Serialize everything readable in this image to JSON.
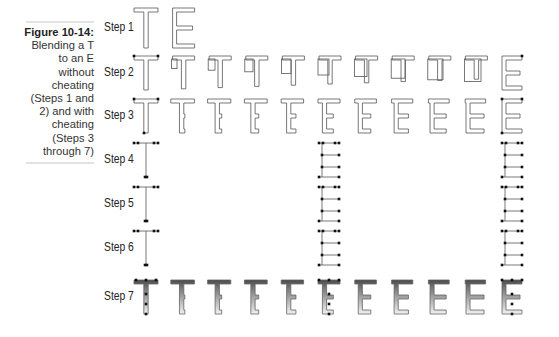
{
  "caption": {
    "figure_label": "Figure 10-14:",
    "text_lines": [
      "Blending a T",
      "to an E",
      "without",
      "cheating",
      "(Steps 1 and",
      "2) and with",
      "cheating",
      "(Steps 3",
      "through 7)"
    ]
  },
  "steps": [
    {
      "label": "Step 1",
      "y": 28,
      "columns": [
        0,
        1
      ],
      "kind": "outline-te"
    },
    {
      "label": "Step 2",
      "y": 73,
      "columns": [
        0,
        1,
        2,
        3,
        4,
        5,
        6,
        7,
        8,
        9,
        10
      ],
      "kind": "blend-no-cheat"
    },
    {
      "label": "Step 3",
      "y": 116,
      "columns": [
        0,
        1,
        2,
        3,
        4,
        5,
        6,
        7,
        8,
        9,
        10
      ],
      "kind": "blend-cheat-outline"
    },
    {
      "label": "Step 4",
      "y": 160,
      "columns": [
        0,
        5,
        10
      ],
      "kind": "points"
    },
    {
      "label": "Step 5",
      "y": 204,
      "columns": [
        0,
        5,
        10
      ],
      "kind": "points"
    },
    {
      "label": "Step 6",
      "y": 248,
      "columns": [
        0,
        5,
        10
      ],
      "kind": "points"
    },
    {
      "label": "Step 7",
      "y": 297,
      "columns": [
        0,
        1,
        2,
        3,
        4,
        5,
        6,
        7,
        8,
        9,
        10
      ],
      "kind": "gradient-blend"
    }
  ],
  "colors": {
    "stroke": "#555555",
    "point": "#111111",
    "gradient_top": "#555555",
    "gradient_bottom": "#f4f4f4"
  }
}
